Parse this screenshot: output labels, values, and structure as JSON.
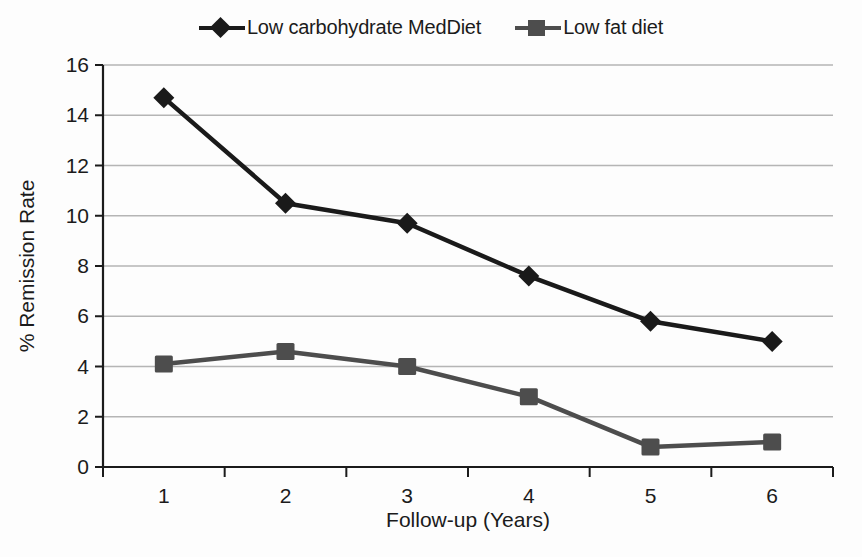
{
  "chart_data": {
    "type": "line",
    "title": "",
    "xlabel": "Follow-up (Years)",
    "ylabel": "% Remission Rate",
    "categories": [
      "1",
      "2",
      "3",
      "4",
      "5",
      "6"
    ],
    "x": [
      1,
      2,
      3,
      4,
      5,
      6
    ],
    "xlim": [
      0.5,
      6.5
    ],
    "ylim": [
      0,
      16
    ],
    "yticks": [
      0,
      2,
      4,
      6,
      8,
      10,
      12,
      14,
      16
    ],
    "ytick_labels": [
      "0",
      "2",
      "4",
      "6",
      "8",
      "10",
      "12",
      "14",
      "16"
    ],
    "grid": "horizontal",
    "legend_position": "top-center",
    "series": [
      {
        "name": "Low carbohydrate MedDiet",
        "marker": "diamond",
        "color": "#1a1a1a",
        "values": [
          14.7,
          10.5,
          9.7,
          7.6,
          5.8,
          5.0
        ]
      },
      {
        "name": "Low fat diet",
        "marker": "square",
        "color": "#4d4d4d",
        "values": [
          4.1,
          4.6,
          4.0,
          2.8,
          0.8,
          1.0
        ]
      }
    ]
  },
  "legend": {
    "entries": [
      {
        "label": "Low carbohydrate MedDiet",
        "marker": "diamond-marker-icon",
        "color": "#1a1a1a"
      },
      {
        "label": "Low fat diet",
        "marker": "square-marker-icon",
        "color": "#4d4d4d"
      }
    ]
  },
  "axes": {
    "x_title": "Follow-up (Years)",
    "y_title": "% Remission Rate",
    "x_tick_labels": [
      "1",
      "2",
      "3",
      "4",
      "5",
      "6"
    ],
    "y_tick_labels": [
      "16",
      "14",
      "12",
      "10",
      "8",
      "6",
      "4",
      "2",
      "0"
    ]
  },
  "colors": {
    "background": "#fdfdfd",
    "gridline": "#b5b5b5",
    "axis": "#1b1b1b",
    "series_dark": "#1a1a1a",
    "series_gray": "#4d4d4d",
    "text": "#1b1b1b"
  }
}
